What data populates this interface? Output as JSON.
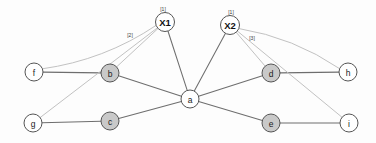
{
  "canvas": {
    "width": 376,
    "height": 143,
    "background_color": "#fdfdfd"
  },
  "graph": {
    "title": "",
    "node_fill_white": "#ffffff",
    "node_fill_gray": "#c9c9c9",
    "node_stroke_color": "#555555",
    "edge_structural_color": "#6e6e6e",
    "edge_annotated_color": "#c2c2c2",
    "nodes": [
      {
        "id": "X1",
        "label": "X1",
        "x": 165,
        "y": 22,
        "r": 9.5,
        "fill": "white",
        "emphasis": "bold"
      },
      {
        "id": "X2",
        "label": "X2",
        "x": 230,
        "y": 25,
        "r": 9.5,
        "fill": "white",
        "emphasis": "bold"
      },
      {
        "id": "a",
        "label": "a",
        "x": 190,
        "y": 99,
        "r": 9,
        "fill": "white",
        "emphasis": "normal"
      },
      {
        "id": "b",
        "label": "b",
        "x": 110,
        "y": 73,
        "r": 9,
        "fill": "gray",
        "emphasis": "normal"
      },
      {
        "id": "c",
        "label": "c",
        "x": 110,
        "y": 121,
        "r": 9,
        "fill": "gray",
        "emphasis": "normal"
      },
      {
        "id": "d",
        "label": "d",
        "x": 271,
        "y": 73,
        "r": 9,
        "fill": "gray",
        "emphasis": "normal"
      },
      {
        "id": "e",
        "label": "e",
        "x": 271,
        "y": 123,
        "r": 9,
        "fill": "gray",
        "emphasis": "normal"
      },
      {
        "id": "f",
        "label": "f",
        "x": 34,
        "y": 72,
        "r": 9,
        "fill": "white",
        "emphasis": "normal"
      },
      {
        "id": "g",
        "label": "g",
        "x": 33,
        "y": 123,
        "r": 9,
        "fill": "white",
        "emphasis": "normal"
      },
      {
        "id": "h",
        "label": "h",
        "x": 348,
        "y": 72,
        "r": 9,
        "fill": "white",
        "emphasis": "normal"
      },
      {
        "id": "i",
        "label": "i",
        "x": 349,
        "y": 123,
        "r": 9,
        "fill": "white",
        "emphasis": "normal"
      }
    ],
    "edges": [
      {
        "from": "f",
        "to": "b",
        "kind": "structural",
        "curve": 0
      },
      {
        "from": "b",
        "to": "a",
        "kind": "structural",
        "curve": 0
      },
      {
        "from": "g",
        "to": "c",
        "kind": "structural",
        "curve": 0
      },
      {
        "from": "c",
        "to": "a",
        "kind": "structural",
        "curve": 0
      },
      {
        "from": "a",
        "to": "d",
        "kind": "structural",
        "curve": 0
      },
      {
        "from": "a",
        "to": "e",
        "kind": "structural",
        "curve": 0
      },
      {
        "from": "d",
        "to": "h",
        "kind": "structural",
        "curve": 0
      },
      {
        "from": "e",
        "to": "i",
        "kind": "structural",
        "curve": 0
      },
      {
        "from": "X1",
        "to": "a",
        "kind": "structural",
        "curve": 0
      },
      {
        "from": "X2",
        "to": "a",
        "kind": "structural",
        "curve": 0
      },
      {
        "from": "X1",
        "to": "f",
        "kind": "annotated",
        "curve": -14
      },
      {
        "from": "X1",
        "to": "b",
        "kind": "annotated",
        "curve": 0
      },
      {
        "from": "X1",
        "to": "g",
        "kind": "annotated",
        "curve": 0
      },
      {
        "from": "X2",
        "to": "d",
        "kind": "annotated",
        "curve": 0
      },
      {
        "from": "X2",
        "to": "i",
        "kind": "annotated",
        "curve": 0
      },
      {
        "from": "X2",
        "to": "h",
        "kind": "annotated",
        "curve": -12
      }
    ],
    "annotations": [
      {
        "id": "x1-count",
        "text": "[1]",
        "x": 163,
        "y": 9
      },
      {
        "id": "x1-edge-2",
        "text": "[2]",
        "x": 130,
        "y": 35
      },
      {
        "id": "x2-count",
        "text": "[1]",
        "x": 231,
        "y": 12
      },
      {
        "id": "x2-edge-3",
        "text": "[3]",
        "x": 252,
        "y": 38
      }
    ]
  }
}
